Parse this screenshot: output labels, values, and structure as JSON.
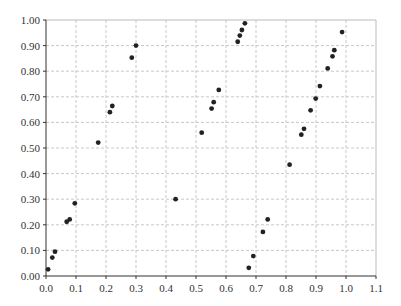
{
  "chart_data": {
    "type": "scatter",
    "title": "",
    "xlabel": "",
    "ylabel": "",
    "xlim": [
      0.0,
      1.1
    ],
    "ylim": [
      0.0,
      1.0
    ],
    "grid": true,
    "legend": null,
    "x_ticks": [
      "0.0",
      "0.1",
      "0.2",
      "0.3",
      "0.4",
      "0.5",
      "0.6",
      "0.7",
      "0.8",
      "0.9",
      "1.0",
      "1.1"
    ],
    "y_ticks": [
      "0.00",
      "0.10",
      "0.20",
      "0.30",
      "0.40",
      "0.50",
      "0.60",
      "0.70",
      "0.80",
      "0.90",
      "1.00"
    ],
    "series": [
      {
        "name": "points",
        "color": "#222222",
        "points": [
          {
            "x": 0.007,
            "y": 0.026
          },
          {
            "x": 0.021,
            "y": 0.072
          },
          {
            "x": 0.03,
            "y": 0.095
          },
          {
            "x": 0.069,
            "y": 0.212
          },
          {
            "x": 0.079,
            "y": 0.221
          },
          {
            "x": 0.096,
            "y": 0.284
          },
          {
            "x": 0.174,
            "y": 0.521
          },
          {
            "x": 0.213,
            "y": 0.64
          },
          {
            "x": 0.221,
            "y": 0.664
          },
          {
            "x": 0.286,
            "y": 0.853
          },
          {
            "x": 0.3,
            "y": 0.9
          },
          {
            "x": 0.432,
            "y": 0.3
          },
          {
            "x": 0.519,
            "y": 0.56
          },
          {
            "x": 0.552,
            "y": 0.654
          },
          {
            "x": 0.559,
            "y": 0.679
          },
          {
            "x": 0.576,
            "y": 0.727
          },
          {
            "x": 0.639,
            "y": 0.915
          },
          {
            "x": 0.646,
            "y": 0.939
          },
          {
            "x": 0.653,
            "y": 0.961
          },
          {
            "x": 0.663,
            "y": 0.987
          },
          {
            "x": 0.676,
            "y": 0.032
          },
          {
            "x": 0.691,
            "y": 0.078
          },
          {
            "x": 0.723,
            "y": 0.172
          },
          {
            "x": 0.739,
            "y": 0.221
          },
          {
            "x": 0.812,
            "y": 0.435
          },
          {
            "x": 0.851,
            "y": 0.552
          },
          {
            "x": 0.86,
            "y": 0.575
          },
          {
            "x": 0.882,
            "y": 0.647
          },
          {
            "x": 0.899,
            "y": 0.693
          },
          {
            "x": 0.913,
            "y": 0.742
          },
          {
            "x": 0.939,
            "y": 0.811
          },
          {
            "x": 0.955,
            "y": 0.858
          },
          {
            "x": 0.961,
            "y": 0.882
          },
          {
            "x": 0.987,
            "y": 0.953
          }
        ]
      }
    ]
  },
  "style": {
    "axis_color": "#333333",
    "frame_color": "#bbbbbb",
    "grid_color": "#c8c8c8",
    "marker_color": "#222222"
  }
}
